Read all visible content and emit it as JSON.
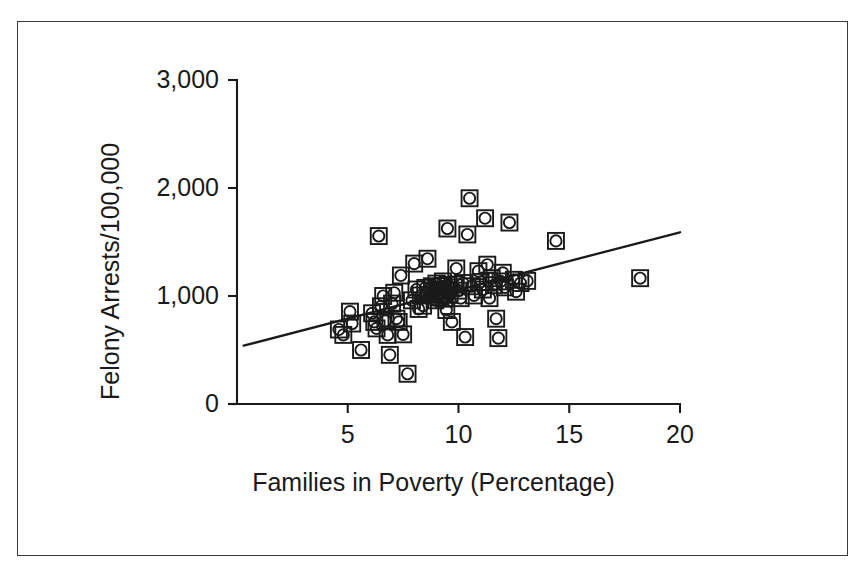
{
  "figure": {
    "kind": "scatter-plot-with-regression-line",
    "background_color": "#ffffff",
    "ink_color": "#1a1a1a",
    "border_color": "#3a3a3a",
    "marker_style": "open-square-with-inscribed-circle"
  },
  "chart_data": {
    "type": "scatter",
    "title": "",
    "xlabel": "Families in Poverty (Percentage)",
    "ylabel": "Felony Arrests/100,000",
    "xlim": [
      0,
      20
    ],
    "ylim": [
      0,
      3000
    ],
    "xticks": [
      5,
      10,
      15,
      20
    ],
    "xticklabels": [
      "5",
      "10",
      "15",
      "20"
    ],
    "yticks": [
      0,
      1000,
      2000,
      3000
    ],
    "yticklabels": [
      "0",
      "1,000",
      "2,000",
      "3,000"
    ],
    "grid": false,
    "legend": null,
    "axis_style": "L-shaped spines, outward ticks",
    "trendline": {
      "kind": "linear-regression",
      "x_start": 0.3,
      "y_start": 540,
      "x_end": 20.0,
      "y_end": 1590,
      "slope_per_percent": 53.3,
      "intercept": 524
    },
    "points": [
      {
        "x": 4.6,
        "y": 690
      },
      {
        "x": 4.8,
        "y": 640
      },
      {
        "x": 5.1,
        "y": 855
      },
      {
        "x": 5.2,
        "y": 745
      },
      {
        "x": 5.6,
        "y": 500
      },
      {
        "x": 6.1,
        "y": 840
      },
      {
        "x": 6.2,
        "y": 760
      },
      {
        "x": 6.3,
        "y": 700
      },
      {
        "x": 6.4,
        "y": 1555
      },
      {
        "x": 6.5,
        "y": 905
      },
      {
        "x": 6.6,
        "y": 1000
      },
      {
        "x": 6.7,
        "y": 770
      },
      {
        "x": 6.8,
        "y": 640
      },
      {
        "x": 6.9,
        "y": 455
      },
      {
        "x": 7.0,
        "y": 930
      },
      {
        "x": 7.1,
        "y": 1030
      },
      {
        "x": 7.2,
        "y": 790
      },
      {
        "x": 7.3,
        "y": 760
      },
      {
        "x": 7.4,
        "y": 1190
      },
      {
        "x": 7.5,
        "y": 645
      },
      {
        "x": 7.7,
        "y": 280
      },
      {
        "x": 7.9,
        "y": 960
      },
      {
        "x": 8.0,
        "y": 1300
      },
      {
        "x": 8.1,
        "y": 1060
      },
      {
        "x": 8.2,
        "y": 880
      },
      {
        "x": 8.3,
        "y": 1005
      },
      {
        "x": 8.4,
        "y": 910
      },
      {
        "x": 8.5,
        "y": 1075
      },
      {
        "x": 8.6,
        "y": 1345
      },
      {
        "x": 8.7,
        "y": 1010
      },
      {
        "x": 8.8,
        "y": 1090
      },
      {
        "x": 8.9,
        "y": 1040
      },
      {
        "x": 8.95,
        "y": 960
      },
      {
        "x": 9.0,
        "y": 1115
      },
      {
        "x": 9.05,
        "y": 1050
      },
      {
        "x": 9.1,
        "y": 990
      },
      {
        "x": 9.15,
        "y": 1060
      },
      {
        "x": 9.2,
        "y": 1025
      },
      {
        "x": 9.25,
        "y": 1090
      },
      {
        "x": 9.3,
        "y": 1135
      },
      {
        "x": 9.35,
        "y": 975
      },
      {
        "x": 9.4,
        "y": 1045
      },
      {
        "x": 9.45,
        "y": 870
      },
      {
        "x": 9.5,
        "y": 1625
      },
      {
        "x": 9.55,
        "y": 1100
      },
      {
        "x": 9.6,
        "y": 1010
      },
      {
        "x": 9.7,
        "y": 760
      },
      {
        "x": 9.8,
        "y": 1080
      },
      {
        "x": 9.9,
        "y": 1255
      },
      {
        "x": 10.0,
        "y": 1050
      },
      {
        "x": 10.1,
        "y": 980
      },
      {
        "x": 10.2,
        "y": 1120
      },
      {
        "x": 10.3,
        "y": 620
      },
      {
        "x": 10.4,
        "y": 1570
      },
      {
        "x": 10.5,
        "y": 1905
      },
      {
        "x": 10.6,
        "y": 1090
      },
      {
        "x": 10.7,
        "y": 1005
      },
      {
        "x": 10.9,
        "y": 1230
      },
      {
        "x": 11.0,
        "y": 1130
      },
      {
        "x": 11.1,
        "y": 1060
      },
      {
        "x": 11.2,
        "y": 1720
      },
      {
        "x": 11.3,
        "y": 1290
      },
      {
        "x": 11.4,
        "y": 980
      },
      {
        "x": 11.5,
        "y": 1165
      },
      {
        "x": 11.6,
        "y": 1100
      },
      {
        "x": 11.7,
        "y": 790
      },
      {
        "x": 11.8,
        "y": 610
      },
      {
        "x": 11.9,
        "y": 1135
      },
      {
        "x": 12.0,
        "y": 1215
      },
      {
        "x": 12.1,
        "y": 1080
      },
      {
        "x": 12.3,
        "y": 1680
      },
      {
        "x": 12.5,
        "y": 1150
      },
      {
        "x": 12.6,
        "y": 1040
      },
      {
        "x": 12.8,
        "y": 1120
      },
      {
        "x": 13.1,
        "y": 1140
      },
      {
        "x": 14.4,
        "y": 1510
      },
      {
        "x": 18.2,
        "y": 1165
      }
    ]
  },
  "geometry": {
    "x_pixel_at_zero": 237,
    "x_pixels_per_unit": 22.15,
    "y_pixel_at_zero": 404,
    "y_pixels_per_unit": 0.108,
    "marker_square_size": 16,
    "marker_circle_radius": 5.6
  }
}
